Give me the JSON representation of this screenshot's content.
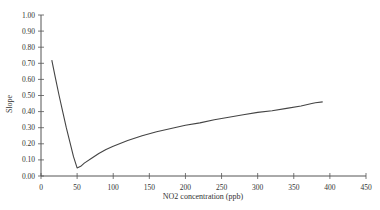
{
  "chart_data": {
    "type": "line",
    "title": "",
    "xlabel": "NO2 concentration (ppb)",
    "ylabel": "Slope",
    "xlim": [
      0,
      450
    ],
    "ylim": [
      0,
      1.0
    ],
    "x_ticks": [
      "0",
      "50",
      "100",
      "150",
      "200",
      "250",
      "300",
      "350",
      "400",
      "450"
    ],
    "y_ticks": [
      "0.00",
      "0.10",
      "0.20",
      "0.30",
      "0.40",
      "0.50",
      "0.60",
      "0.70",
      "0.80",
      "0.90",
      "1.00"
    ],
    "grid": false,
    "legend": null,
    "series": [
      {
        "name": "Slope",
        "x": [
          15,
          20,
          25,
          30,
          35,
          40,
          45,
          50,
          55,
          60,
          70,
          80,
          90,
          100,
          120,
          140,
          160,
          180,
          200,
          220,
          240,
          260,
          280,
          300,
          320,
          340,
          360,
          375,
          380,
          390
        ],
        "y": [
          0.72,
          0.61,
          0.5,
          0.4,
          0.3,
          0.21,
          0.12,
          0.05,
          0.06,
          0.08,
          0.11,
          0.14,
          0.165,
          0.185,
          0.22,
          0.25,
          0.275,
          0.295,
          0.315,
          0.33,
          0.35,
          0.365,
          0.38,
          0.395,
          0.405,
          0.42,
          0.435,
          0.45,
          0.455,
          0.46
        ]
      }
    ]
  }
}
